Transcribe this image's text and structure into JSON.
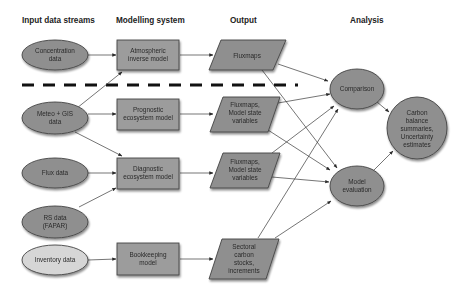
{
  "headers": {
    "input": "Input data streams",
    "modelling": "Modelling system",
    "output": "Output",
    "analysis": "Analysis"
  },
  "colors": {
    "shape_fill": "#8f8f8f",
    "box_fill": "#9c9c9c",
    "light_fill": "#d6d6d6",
    "edge": "#3a3a3a",
    "dashed_line": "#111111"
  },
  "inputs": [
    {
      "id": "concentration",
      "lines": [
        "Concentration",
        "data"
      ]
    },
    {
      "id": "meteo-gis",
      "lines": [
        "Meteo + GIS",
        "data"
      ]
    },
    {
      "id": "flux",
      "lines": [
        "Flux data"
      ]
    },
    {
      "id": "rs",
      "lines": [
        "RS data",
        "(FAPAR)"
      ]
    },
    {
      "id": "inventory",
      "lines": [
        "Inventory data"
      ]
    }
  ],
  "models": [
    {
      "id": "atmospheric",
      "lines": [
        "Atmospheric",
        "inverse model"
      ]
    },
    {
      "id": "prognostic",
      "lines": [
        "Prognostic",
        "ecosystem model"
      ]
    },
    {
      "id": "diagnostic",
      "lines": [
        "Diagnostic",
        "ecosystem model"
      ]
    },
    {
      "id": "bookkeeping",
      "lines": [
        "Bookkeeping",
        "model"
      ]
    }
  ],
  "outputs": [
    {
      "id": "fluxmaps-1",
      "lines": [
        "Fluxmaps"
      ]
    },
    {
      "id": "fluxmaps-2",
      "lines": [
        "Fluxmaps,",
        "Model state",
        "variables"
      ]
    },
    {
      "id": "fluxmaps-3",
      "lines": [
        "Fluxmaps,",
        "Model state",
        "variables"
      ]
    },
    {
      "id": "sectoral",
      "lines": [
        "Sectoral",
        "carbon",
        "stocks,",
        "increments"
      ]
    }
  ],
  "analysis": [
    {
      "id": "comparison",
      "lines": [
        "Comparison"
      ]
    },
    {
      "id": "model-evaluation",
      "lines": [
        "Model",
        "evaluation"
      ]
    },
    {
      "id": "carbon-balance",
      "lines": [
        "Carbon",
        "balance",
        "summaries,",
        "Uncertainty",
        "estimates"
      ]
    }
  ],
  "edges": [
    [
      "concentration",
      "atmospheric"
    ],
    [
      "meteo-gis",
      "atmospheric"
    ],
    [
      "meteo-gis",
      "prognostic"
    ],
    [
      "meteo-gis",
      "diagnostic"
    ],
    [
      "flux",
      "diagnostic"
    ],
    [
      "rs",
      "diagnostic"
    ],
    [
      "inventory",
      "bookkeeping"
    ],
    [
      "atmospheric",
      "fluxmaps-1"
    ],
    [
      "prognostic",
      "fluxmaps-2"
    ],
    [
      "diagnostic",
      "fluxmaps-3"
    ],
    [
      "bookkeeping",
      "sectoral"
    ],
    [
      "fluxmaps-1",
      "comparison"
    ],
    [
      "fluxmaps-1",
      "model-evaluation"
    ],
    [
      "fluxmaps-2",
      "comparison"
    ],
    [
      "fluxmaps-2",
      "model-evaluation"
    ],
    [
      "fluxmaps-3",
      "comparison"
    ],
    [
      "fluxmaps-3",
      "model-evaluation"
    ],
    [
      "sectoral",
      "comparison"
    ],
    [
      "sectoral",
      "model-evaluation"
    ],
    [
      "comparison",
      "carbon-balance"
    ],
    [
      "model-evaluation",
      "carbon-balance"
    ]
  ]
}
